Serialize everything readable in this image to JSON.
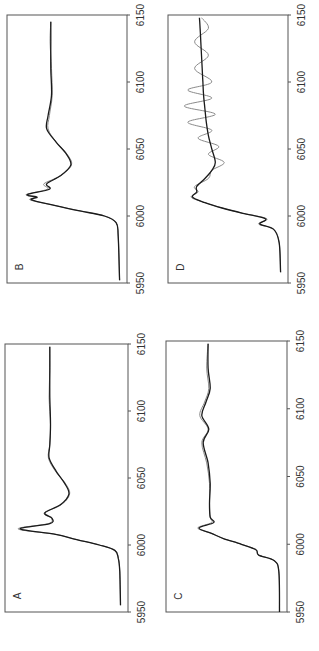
{
  "figure": {
    "orientation": "rotated-90-ccw",
    "colors": {
      "experiment": "#8a8a8a",
      "fit": "#1a1a1a",
      "frame": "#555555"
    }
  },
  "panels": [
    {
      "id": "A",
      "label": "A"
    },
    {
      "id": "B",
      "label": "B"
    },
    {
      "id": "C",
      "label": "C"
    },
    {
      "id": "D",
      "label": "D"
    }
  ],
  "axis": {
    "ticks": [
      "5950",
      "6000",
      "6050",
      "6100",
      "6150"
    ]
  },
  "chart_data": [
    {
      "type": "line",
      "title": "A",
      "xlabel": "",
      "ylabel": "",
      "xlim": [
        5950,
        6150
      ],
      "x_ticks": [
        5950,
        6000,
        6050,
        6100,
        6150
      ],
      "grid": false,
      "series": [
        {
          "name": "experiment",
          "color": "#8a8a8a",
          "x": [
            5955,
            5980,
            5990,
            5996,
            6000,
            6004,
            6008,
            6012,
            6016,
            6020,
            6024,
            6030,
            6038,
            6046,
            6055,
            6065,
            6075,
            6090,
            6110,
            6130,
            6148
          ],
          "y": [
            0.0,
            0.01,
            0.03,
            0.08,
            0.3,
            0.62,
            0.92,
            1.45,
            1.02,
            0.98,
            1.08,
            0.84,
            0.72,
            0.78,
            0.92,
            1.02,
            1.0,
            0.99,
            1.01,
            1.0,
            1.0
          ]
        },
        {
          "name": "fit",
          "color": "#1a1a1a",
          "x": [
            5955,
            5980,
            5990,
            5996,
            6000,
            6004,
            6008,
            6012,
            6016,
            6020,
            6024,
            6030,
            6038,
            6046,
            6055,
            6065,
            6075,
            6090,
            6110,
            6130,
            6148
          ],
          "y": [
            0.0,
            0.01,
            0.03,
            0.08,
            0.3,
            0.62,
            0.92,
            1.42,
            1.0,
            0.97,
            1.07,
            0.85,
            0.73,
            0.79,
            0.91,
            1.01,
            1.0,
            0.99,
            1.0,
            1.0,
            1.0
          ]
        }
      ]
    },
    {
      "type": "line",
      "title": "B",
      "xlabel": "",
      "ylabel": "",
      "xlim": [
        5950,
        6150
      ],
      "x_ticks": [
        5950,
        6000,
        6050,
        6100,
        6150
      ],
      "grid": false,
      "series": [
        {
          "name": "experiment",
          "color": "#8a8a8a",
          "x": [
            5952,
            5985,
            5995,
            6000,
            6004,
            6008,
            6012,
            6014,
            6016,
            6020,
            6024,
            6030,
            6038,
            6046,
            6055,
            6065,
            6075,
            6090,
            6110,
            6130,
            6145
          ],
          "y": [
            0.0,
            0.02,
            0.05,
            0.22,
            0.6,
            0.95,
            1.3,
            1.22,
            1.36,
            1.05,
            1.1,
            0.86,
            0.7,
            0.76,
            0.92,
            1.04,
            1.02,
            0.98,
            0.99,
            1.01,
            1.0
          ]
        },
        {
          "name": "fit",
          "color": "#1a1a1a",
          "x": [
            5952,
            5985,
            5995,
            6000,
            6004,
            6008,
            6012,
            6014,
            6016,
            6020,
            6024,
            6030,
            6038,
            6046,
            6055,
            6065,
            6075,
            6090,
            6110,
            6130,
            6145
          ],
          "y": [
            0.0,
            0.02,
            0.05,
            0.22,
            0.6,
            0.95,
            1.28,
            1.2,
            1.34,
            1.02,
            1.06,
            0.86,
            0.71,
            0.77,
            0.92,
            1.06,
            1.04,
            0.99,
            1.0,
            1.0,
            1.0
          ]
        }
      ]
    },
    {
      "type": "line",
      "title": "C",
      "xlabel": "",
      "ylabel": "",
      "xlim": [
        5950,
        6150
      ],
      "x_ticks": [
        5950,
        6000,
        6050,
        6100,
        6150
      ],
      "grid": false,
      "series": [
        {
          "name": "experiment",
          "color": "#8a8a8a",
          "x": [
            5950,
            5980,
            5988,
            5992,
            5996,
            6000,
            6004,
            6008,
            6012,
            6016,
            6020,
            6030,
            6045,
            6060,
            6075,
            6085,
            6095,
            6105,
            6115,
            6130,
            6148
          ],
          "y": [
            0.0,
            0.01,
            0.08,
            0.3,
            0.34,
            0.55,
            0.8,
            0.98,
            1.18,
            0.98,
            1.0,
            1.01,
            1.01,
            1.05,
            1.12,
            1.03,
            1.15,
            1.08,
            1.02,
            1.05,
            1.03
          ]
        },
        {
          "name": "fit",
          "color": "#1a1a1a",
          "x": [
            5950,
            5980,
            5988,
            5992,
            5996,
            6000,
            6004,
            6008,
            6012,
            6016,
            6020,
            6030,
            6045,
            6060,
            6075,
            6085,
            6095,
            6105,
            6115,
            6130,
            6148
          ],
          "y": [
            0.0,
            0.01,
            0.08,
            0.3,
            0.34,
            0.55,
            0.8,
            0.98,
            1.16,
            0.95,
            1.0,
            1.01,
            1.0,
            1.03,
            1.1,
            1.02,
            1.12,
            1.06,
            1.0,
            1.03,
            1.03
          ]
        }
      ]
    },
    {
      "type": "line",
      "title": "D",
      "xlabel": "",
      "ylabel": "",
      "xlim": [
        5950,
        6150
      ],
      "x_ticks": [
        5950,
        6000,
        6050,
        6100,
        6150
      ],
      "grid": false,
      "series": [
        {
          "name": "experiment",
          "color": "#8a8a8a",
          "x": [
            5958,
            5980,
            5990,
            5994,
            5998,
            6002,
            6006,
            6010,
            6014,
            6018,
            6022,
            6028,
            6034,
            6040,
            6046,
            6052,
            6058,
            6064,
            6070,
            6076,
            6082,
            6088,
            6094,
            6100,
            6110,
            6120,
            6130,
            6140,
            6148
          ],
          "y": [
            0.0,
            0.02,
            0.1,
            0.32,
            0.2,
            0.55,
            0.85,
            1.1,
            1.3,
            1.2,
            1.25,
            1.05,
            1.0,
            0.82,
            1.05,
            0.9,
            1.2,
            1.0,
            1.35,
            0.95,
            1.4,
            1.0,
            1.35,
            1.0,
            1.25,
            1.05,
            1.25,
            1.05,
            1.15
          ]
        },
        {
          "name": "fit",
          "color": "#1a1a1a",
          "x": [
            5958,
            5980,
            5990,
            5994,
            5998,
            6002,
            6006,
            6010,
            6014,
            6018,
            6022,
            6028,
            6034,
            6040,
            6050,
            6060,
            6070,
            6080,
            6090,
            6100,
            6110,
            6120,
            6130,
            6140,
            6148
          ],
          "y": [
            0.0,
            0.02,
            0.1,
            0.3,
            0.22,
            0.55,
            0.85,
            1.1,
            1.28,
            1.22,
            1.22,
            1.1,
            1.0,
            0.95,
            1.0,
            1.05,
            1.08,
            1.1,
            1.12,
            1.13,
            1.14,
            1.15,
            1.16,
            1.17,
            1.18
          ]
        }
      ]
    }
  ]
}
